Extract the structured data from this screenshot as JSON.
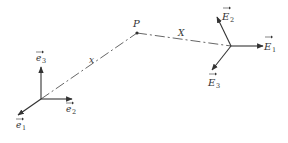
{
  "diagram": {
    "colors": {
      "ink": "#333333",
      "dash": "#555555",
      "background": "#ffffff"
    },
    "point": {
      "label": "P"
    },
    "vectors": {
      "x": {
        "label": "x"
      },
      "X": {
        "label": "X"
      }
    },
    "frame_e": {
      "axes": [
        {
          "name": "e",
          "sub": "1"
        },
        {
          "name": "e",
          "sub": "2"
        },
        {
          "name": "e",
          "sub": "3"
        }
      ]
    },
    "frame_E": {
      "axes": [
        {
          "name": "E",
          "sub": "1"
        },
        {
          "name": "E",
          "sub": "2"
        },
        {
          "name": "E",
          "sub": "3"
        }
      ]
    }
  }
}
